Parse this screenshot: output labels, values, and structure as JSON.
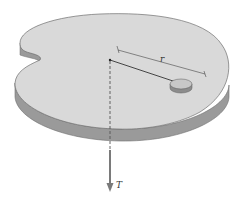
{
  "figure": {
    "labels": {
      "radius": "r",
      "tension": "T"
    },
    "colors": {
      "table_top": "#d9d9d9",
      "table_side": "#9a9a9a",
      "table_edge": "#6e6e6e",
      "puck_top": "#c8c8c8",
      "puck_side": "#8c8c8c",
      "string": "#333333",
      "arrow": "#7a7a7a",
      "dimension_line": "#444444"
    }
  }
}
